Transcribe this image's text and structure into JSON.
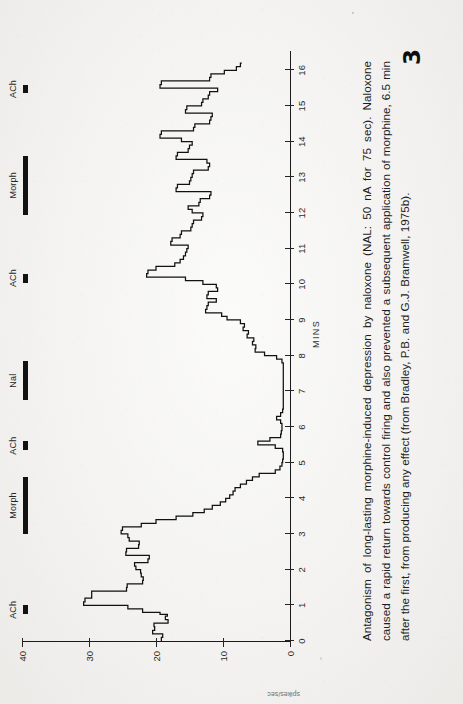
{
  "page": {
    "number": "3",
    "orientation": "landscape-figure-on-portrait-page"
  },
  "figure": {
    "caption": "Antagonism of long-lasting morphine-induced depression by naloxone (NAL: 50 nA for 75 sec). Naloxone caused a rapid return towards control firing and also prevented a subsequent application of morphine, 6.5 min after the first, from producing any effect (from Bradley, P.B. and G.J. Bramwell, 1975b).",
    "x_axis_title": "MINS",
    "y_axis_title": "spikes/sec",
    "drug_events": [
      {
        "label": "ACh",
        "start_min": 0.75,
        "end_min": 1.0
      },
      {
        "label": "Morph",
        "start_min": 3.0,
        "end_min": 4.6
      },
      {
        "label": "ACh",
        "start_min": 5.35,
        "end_min": 5.6
      },
      {
        "label": "Nal",
        "start_min": 6.75,
        "end_min": 7.85
      },
      {
        "label": "ACh",
        "start_min": 10.05,
        "end_min": 10.3
      },
      {
        "label": "Morph",
        "start_min": 11.95,
        "end_min": 13.6
      },
      {
        "label": "ACh",
        "start_min": 15.35,
        "end_min": 15.6
      }
    ]
  },
  "chart_data": {
    "type": "line",
    "title": "",
    "xlabel": "MINS",
    "ylabel": "spikes/sec",
    "xlim": [
      0,
      16.4
    ],
    "ylim": [
      0,
      40
    ],
    "grid": false,
    "legend": "none",
    "xticks": [
      0,
      1,
      2,
      3,
      4,
      5,
      6,
      7,
      8,
      9,
      10,
      11,
      12,
      13,
      14,
      15,
      16
    ],
    "yticks": [
      0,
      10,
      20,
      30,
      40
    ],
    "style": "step-histogram (ratemeter record)",
    "x": [
      0.0,
      0.1,
      0.2,
      0.3,
      0.4,
      0.5,
      0.6,
      0.7,
      0.75,
      0.8,
      0.9,
      1.0,
      1.1,
      1.2,
      1.3,
      1.4,
      1.5,
      1.6,
      1.7,
      1.8,
      1.9,
      2.0,
      2.1,
      2.2,
      2.3,
      2.4,
      2.5,
      2.6,
      2.7,
      2.8,
      2.9,
      3.0,
      3.1,
      3.2,
      3.3,
      3.4,
      3.5,
      3.6,
      3.7,
      3.8,
      3.9,
      4.0,
      4.1,
      4.2,
      4.3,
      4.4,
      4.5,
      4.6,
      4.7,
      4.8,
      4.9,
      5.0,
      5.1,
      5.2,
      5.3,
      5.4,
      5.5,
      5.6,
      5.7,
      5.8,
      5.9,
      6.0,
      6.1,
      6.2,
      6.3,
      6.4,
      6.5,
      6.6,
      6.7,
      6.8,
      6.9,
      7.0,
      7.2,
      7.4,
      7.6,
      7.8,
      7.9,
      8.0,
      8.1,
      8.2,
      8.3,
      8.4,
      8.5,
      8.6,
      8.7,
      8.8,
      8.9,
      9.0,
      9.1,
      9.2,
      9.3,
      9.4,
      9.5,
      9.6,
      9.7,
      9.8,
      9.9,
      10.0,
      10.1,
      10.2,
      10.3,
      10.4,
      10.5,
      10.6,
      10.7,
      10.8,
      10.9,
      11.0,
      11.1,
      11.2,
      11.3,
      11.4,
      11.5,
      11.6,
      11.7,
      11.8,
      11.9,
      12.0,
      12.1,
      12.2,
      12.3,
      12.4,
      12.5,
      12.6,
      12.7,
      12.8,
      12.9,
      13.0,
      13.1,
      13.2,
      13.3,
      13.4,
      13.5,
      13.6,
      13.7,
      13.8,
      13.9,
      14.0,
      14.1,
      14.2,
      14.3,
      14.4,
      14.5,
      14.6,
      14.7,
      14.8,
      14.9,
      15.0,
      15.1,
      15.2,
      15.3,
      15.4,
      15.5,
      15.6,
      15.7,
      15.8,
      15.9,
      16.0,
      16.1,
      16.2
    ],
    "values": [
      19.2,
      19.0,
      20.5,
      20.2,
      20.3,
      18.2,
      18.6,
      18.3,
      19.4,
      22.0,
      24.2,
      30.8,
      30.6,
      29.6,
      29.6,
      24.4,
      24.3,
      22.0,
      21.9,
      22.2,
      22.3,
      23.0,
      23.2,
      21.2,
      21.0,
      24.5,
      24.4,
      22.6,
      22.5,
      24.0,
      24.2,
      25.2,
      25.0,
      22.2,
      20.0,
      17.0,
      14.5,
      12.8,
      11.6,
      10.4,
      9.6,
      9.0,
      8.5,
      8.2,
      7.4,
      6.5,
      5.6,
      4.6,
      2.2,
      1.5,
      1.2,
      1.1,
      1.0,
      1.0,
      1.1,
      2.2,
      4.8,
      3.0,
      1.4,
      1.3,
      1.2,
      1.2,
      1.4,
      2.0,
      1.4,
      1.1,
      1.0,
      1.0,
      1.0,
      1.0,
      1.0,
      1.0,
      1.0,
      1.0,
      1.0,
      1.2,
      2.0,
      3.8,
      5.2,
      5.1,
      5.6,
      5.4,
      6.4,
      6.2,
      7.0,
      6.8,
      7.4,
      9.4,
      10.2,
      12.6,
      12.4,
      12.2,
      11.0,
      12.4,
      12.2,
      10.8,
      11.0,
      13.0,
      15.6,
      21.4,
      21.2,
      20.0,
      17.2,
      16.4,
      15.9,
      15.6,
      15.4,
      15.2,
      17.8,
      17.6,
      16.4,
      16.2,
      14.8,
      14.6,
      14.4,
      13.2,
      13.0,
      14.6,
      15.2,
      13.6,
      13.4,
      12.0,
      11.8,
      17.0,
      16.8,
      15.0,
      14.8,
      14.6,
      14.4,
      12.2,
      12.0,
      12.4,
      17.0,
      16.8,
      15.2,
      15.0,
      14.6,
      16.2,
      19.4,
      19.2,
      14.4,
      14.2,
      12.0,
      11.8,
      11.6,
      15.6,
      15.4,
      13.2,
      13.0,
      12.2,
      12.0,
      10.8,
      19.4,
      19.2,
      12.0,
      11.8,
      9.8,
      8.0,
      7.4,
      7.2
    ]
  }
}
